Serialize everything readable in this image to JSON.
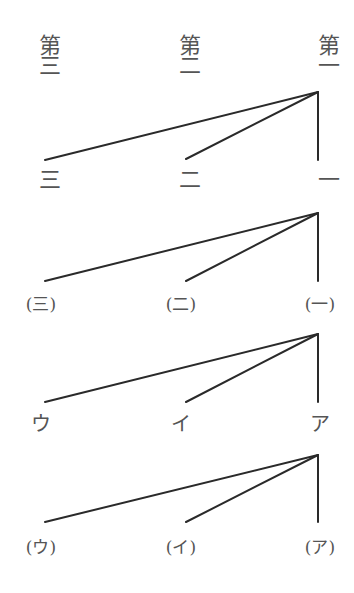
{
  "diagram": {
    "title": "",
    "groups": [
      {
        "level": 1,
        "parent_labels": [
          "第三",
          "第二",
          "第一"
        ],
        "child_labels": [
          "三",
          "二",
          "一"
        ]
      },
      {
        "level": 2,
        "child_labels": [
          "(三)",
          "(二)",
          "(一)"
        ]
      },
      {
        "level": 3,
        "child_labels": [
          "ウ",
          "イ",
          "ア"
        ]
      },
      {
        "level": 4,
        "child_labels": [
          "(ウ)",
          "(イ)",
          "(ア)"
        ]
      }
    ],
    "line_color": "#2a2a2a",
    "text_color": "#555555"
  }
}
